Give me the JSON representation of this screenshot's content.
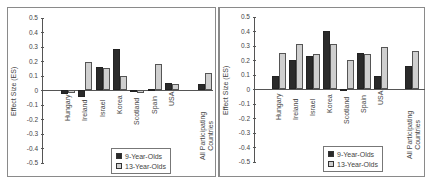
{
  "chart_data": [
    {
      "type": "bar",
      "title": "",
      "xlabel": "",
      "ylabel": "Effect Size (ES)",
      "ylim": [
        -0.5,
        0.5
      ],
      "yticks": [
        "0.5",
        "0.4",
        "0.3",
        "0.2",
        "0.1",
        "0",
        "-0.1",
        "-0.2",
        "-0.3",
        "-0.4",
        "-0.5"
      ],
      "categories": [
        "Hungary",
        "Ireland",
        "Israel",
        "Korea",
        "Scotland",
        "Spain",
        "USA",
        "All Participating Countries"
      ],
      "series": [
        {
          "name": "9-Year-Olds",
          "values": [
            -0.03,
            -0.05,
            0.16,
            0.28,
            -0.01,
            0.01,
            0.05,
            0.04
          ]
        },
        {
          "name": "13-Year-Olds",
          "values": [
            -0.02,
            0.19,
            0.15,
            0.1,
            -0.02,
            0.18,
            0.04,
            0.12
          ]
        }
      ],
      "legend_position": "bottom-center-inside",
      "grid": false
    },
    {
      "type": "bar",
      "title": "",
      "xlabel": "",
      "ylabel": "Effect Size (ES)",
      "ylim": [
        -0.5,
        0.5
      ],
      "yticks": [
        "0.5",
        "0.4",
        "0.3",
        "0.2",
        "0.1",
        "0",
        "-0.1",
        "-0.2",
        "-0.3",
        "-0.4",
        "-0.5"
      ],
      "categories": [
        "Hungary",
        "Ireland",
        "Israel",
        "Korea",
        "Scotland",
        "Spain",
        "USA",
        "All Participating Countries"
      ],
      "series": [
        {
          "name": "9-Year-Olds",
          "values": [
            0.09,
            0.2,
            0.23,
            0.4,
            -0.01,
            0.25,
            0.09,
            0.16
          ]
        },
        {
          "name": "13-Year-Olds",
          "values": [
            0.25,
            0.31,
            0.24,
            0.31,
            0.2,
            0.24,
            0.29,
            0.26
          ]
        }
      ],
      "legend_position": "bottom-center-inside",
      "grid": false
    }
  ],
  "colors": {
    "series_9": "#2a2a2a",
    "series_13": "#cfcfcf",
    "frame": "#8a8a8a"
  }
}
